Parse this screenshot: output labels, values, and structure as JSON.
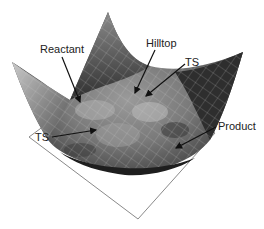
{
  "figure": {
    "type": "potential-energy-surface",
    "labels": {
      "reactant": "Reactant",
      "hilltop": "Hilltop",
      "ts_upper": "TS",
      "ts_left": "TS",
      "product": "Product"
    },
    "colors": {
      "background": "#ffffff",
      "base_plane": "#8a8a8a",
      "arrow": "#111111",
      "surface_dark": "#2a2a2a",
      "surface_mid": "#6e6e6e",
      "surface_light": "#b9b9b9",
      "mesh": "#d0d0d0"
    }
  }
}
